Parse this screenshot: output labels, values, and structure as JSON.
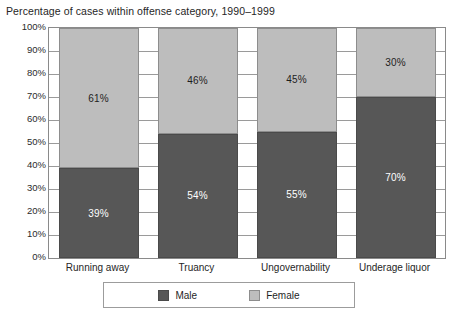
{
  "chart_data": {
    "type": "bar",
    "subtype": "stacked-100-percent",
    "title": "Percentage of cases within offense category, 1990–1999",
    "xlabel": "",
    "ylabel": "",
    "ylim": [
      0,
      100
    ],
    "yticks": [
      "0%",
      "10%",
      "20%",
      "30%",
      "40%",
      "50%",
      "60%",
      "70%",
      "80%",
      "90%",
      "100%"
    ],
    "ytick_values": [
      0,
      10,
      20,
      30,
      40,
      50,
      60,
      70,
      80,
      90,
      100
    ],
    "grid": true,
    "grid_axis": "y",
    "legend_position": "bottom",
    "categories": [
      "Running away",
      "Truancy",
      "Ungovernability",
      "Underage liquor"
    ],
    "series": [
      {
        "name": "Male",
        "color": "#575757",
        "values": [
          39,
          54,
          55,
          70
        ],
        "labels": [
          "39%",
          "54%",
          "55%",
          "70%"
        ]
      },
      {
        "name": "Female",
        "color": "#bdbdbd",
        "values": [
          61,
          46,
          45,
          30
        ],
        "labels": [
          "61%",
          "46%",
          "45%",
          "30%"
        ]
      }
    ]
  },
  "legend": {
    "entries": [
      {
        "label": "Male",
        "swatch": "male-swatch"
      },
      {
        "label": "Female",
        "swatch": "female-swatch"
      }
    ]
  }
}
